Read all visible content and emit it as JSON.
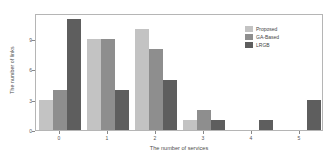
{
  "chart_data": {
    "type": "bar",
    "title": "",
    "xlabel": "The number of services",
    "ylabel": "The number of links",
    "categories": [
      "0",
      "1",
      "2",
      "3",
      "4",
      "5"
    ],
    "series": [
      {
        "name": "Proposed",
        "color": "#c3c3c3",
        "values": [
          3,
          9,
          10,
          1,
          0,
          0
        ]
      },
      {
        "name": "GA-Based",
        "color": "#8e8e8e",
        "values": [
          4,
          9,
          8,
          2,
          0,
          0
        ]
      },
      {
        "name": "LRGB",
        "color": "#5e5e5e",
        "values": [
          11,
          4,
          5,
          1,
          1,
          3
        ]
      }
    ],
    "yticks": [
      0,
      3,
      6,
      9
    ],
    "ylim": [
      0,
      11.6
    ],
    "xticklabels": [
      "0",
      "1",
      "2",
      "3",
      "4",
      "5"
    ],
    "grid": false,
    "legend_position": "top-right",
    "legend_entries": [
      "Proposed",
      "GA-Based",
      "LRGB"
    ]
  },
  "axis": {
    "y_title": "The number of links",
    "x_title": "The number of services"
  },
  "colors": {
    "proposed": "#c3c3c3",
    "ga_based": "#8e8e8e",
    "lrgb": "#5e5e5e",
    "frame": "#b5b5b5",
    "tick_text": "#555555"
  }
}
